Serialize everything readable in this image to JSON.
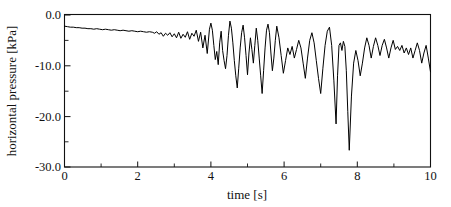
{
  "chart_data": {
    "type": "line",
    "title": "",
    "xlabel": "time [s]",
    "ylabel": "horizontal pressure [kPa]",
    "xlim": [
      0,
      10
    ],
    "ylim": [
      -30.0,
      0.0
    ],
    "grid": false,
    "legend": null,
    "x_ticks": [
      0,
      2,
      4,
      6,
      8,
      10
    ],
    "x_tick_labels": [
      "0",
      "2",
      "4",
      "6",
      "8",
      "10"
    ],
    "x_minor_ticks": [
      1,
      3,
      5,
      7,
      9
    ],
    "y_ticks": [
      0.0,
      -10.0,
      -20.0,
      -30.0
    ],
    "y_tick_labels": [
      "0.0",
      "-10.0",
      "-20.0",
      "-30.0"
    ],
    "y_minor_ticks": [
      -5.0,
      -15.0,
      -25.0
    ],
    "series": [
      {
        "name": "horizontal pressure",
        "color": "#000000",
        "x": [
          0.0,
          0.08,
          0.16,
          0.24,
          0.32,
          0.4,
          0.48,
          0.56,
          0.64,
          0.72,
          0.8,
          0.88,
          0.96,
          1.04,
          1.12,
          1.2,
          1.28,
          1.36,
          1.44,
          1.52,
          1.6,
          1.68,
          1.76,
          1.84,
          1.92,
          2.0,
          2.08,
          2.16,
          2.24,
          2.32,
          2.4,
          2.46,
          2.52,
          2.58,
          2.64,
          2.7,
          2.76,
          2.82,
          2.88,
          2.94,
          3.0,
          3.06,
          3.12,
          3.18,
          3.24,
          3.3,
          3.36,
          3.42,
          3.48,
          3.54,
          3.6,
          3.66,
          3.72,
          3.78,
          3.84,
          3.9,
          3.96,
          4.0,
          4.04,
          4.08,
          4.12,
          4.16,
          4.2,
          4.24,
          4.28,
          4.32,
          4.36,
          4.4,
          4.44,
          4.48,
          4.52,
          4.56,
          4.6,
          4.64,
          4.68,
          4.72,
          4.76,
          4.8,
          4.84,
          4.88,
          4.92,
          4.96,
          5.0,
          5.04,
          5.08,
          5.12,
          5.16,
          5.2,
          5.24,
          5.28,
          5.32,
          5.36,
          5.4,
          5.44,
          5.48,
          5.52,
          5.56,
          5.6,
          5.64,
          5.68,
          5.72,
          5.76,
          5.8,
          5.86,
          5.92,
          5.98,
          6.04,
          6.1,
          6.16,
          6.22,
          6.28,
          6.34,
          6.4,
          6.46,
          6.52,
          6.58,
          6.64,
          6.7,
          6.76,
          6.82,
          6.88,
          6.94,
          7.0,
          7.06,
          7.12,
          7.18,
          7.24,
          7.3,
          7.36,
          7.42,
          7.46,
          7.5,
          7.54,
          7.58,
          7.62,
          7.66,
          7.7,
          7.74,
          7.78,
          7.84,
          7.9,
          7.96,
          8.02,
          8.08,
          8.14,
          8.2,
          8.26,
          8.32,
          8.38,
          8.44,
          8.5,
          8.56,
          8.62,
          8.68,
          8.74,
          8.8,
          8.86,
          8.92,
          8.98,
          9.04,
          9.1,
          9.16,
          9.22,
          9.28,
          9.34,
          9.4,
          9.46,
          9.52,
          9.58,
          9.64,
          9.7,
          9.76,
          9.82,
          9.88,
          9.94,
          10.0
        ],
        "y": [
          -2.2,
          -2.3,
          -2.4,
          -2.4,
          -2.5,
          -2.5,
          -2.6,
          -2.6,
          -2.7,
          -2.7,
          -2.8,
          -2.7,
          -2.8,
          -2.9,
          -2.8,
          -2.9,
          -3.0,
          -2.9,
          -3.0,
          -3.1,
          -3.0,
          -3.1,
          -3.2,
          -3.1,
          -3.2,
          -3.3,
          -3.2,
          -3.3,
          -3.4,
          -3.3,
          -3.4,
          -3.6,
          -3.3,
          -3.8,
          -3.5,
          -4.2,
          -3.6,
          -4.0,
          -3.5,
          -4.3,
          -3.7,
          -4.5,
          -3.4,
          -4.6,
          -3.8,
          -4.4,
          -3.3,
          -4.8,
          -3.6,
          -4.2,
          -3.0,
          -5.2,
          -3.4,
          -6.5,
          -4.0,
          -7.6,
          -2.8,
          -1.6,
          -3.0,
          -6.0,
          -8.8,
          -7.2,
          -9.8,
          -5.5,
          -3.2,
          -7.0,
          -9.0,
          -10.6,
          -8.0,
          -4.0,
          -1.2,
          -2.6,
          -5.5,
          -9.0,
          -12.0,
          -14.4,
          -10.5,
          -6.5,
          -3.5,
          -2.0,
          -4.5,
          -8.0,
          -11.8,
          -7.5,
          -4.5,
          -6.8,
          -9.5,
          -6.0,
          -2.6,
          -5.0,
          -8.5,
          -12.0,
          -15.5,
          -11.0,
          -6.5,
          -3.0,
          -1.8,
          -3.5,
          -7.5,
          -11.0,
          -8.5,
          -5.0,
          -2.2,
          -4.5,
          -8.0,
          -11.5,
          -9.0,
          -6.5,
          -7.8,
          -6.2,
          -8.5,
          -6.8,
          -5.0,
          -6.5,
          -9.5,
          -12.5,
          -8.5,
          -5.0,
          -3.5,
          -5.5,
          -9.0,
          -12.5,
          -15.5,
          -10.5,
          -6.0,
          -3.2,
          -2.4,
          -6.0,
          -13.0,
          -21.5,
          -12.0,
          -6.0,
          -5.5,
          -7.0,
          -5.2,
          -6.2,
          -11.0,
          -19.0,
          -26.7,
          -16.0,
          -9.5,
          -7.0,
          -9.0,
          -12.0,
          -9.5,
          -6.5,
          -4.5,
          -6.0,
          -8.5,
          -6.2,
          -4.5,
          -6.0,
          -8.0,
          -6.0,
          -4.8,
          -6.5,
          -8.5,
          -6.5,
          -5.0,
          -6.8,
          -6.2,
          -7.0,
          -6.0,
          -7.5,
          -6.5,
          -7.8,
          -6.5,
          -8.5,
          -7.0,
          -5.5,
          -7.0,
          -9.5,
          -7.5,
          -6.0,
          -8.5,
          -11.2
        ],
        "y_min": -26.7,
        "y_max": -1.2,
        "n_points": 176
      }
    ],
    "annotations": [
      {
        "label": "deepest-trough",
        "x": 7.62,
        "y": -26.7
      },
      {
        "label": "secondary-trough",
        "x": 7.3,
        "y": -21.5
      },
      {
        "label": "quiescent-start",
        "x": 0.0,
        "y": -2.2
      }
    ]
  },
  "figure": {
    "background_color": "#ffffff",
    "line_color": "#000000",
    "axis_color": "#111111"
  }
}
